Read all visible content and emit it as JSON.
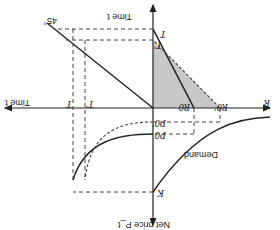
{
  "diagram": {
    "orientation": "rotated-180",
    "colors": {
      "ink": "#222222",
      "shade": "#c8c8c8",
      "dash": "#444444",
      "background": "#ffffff"
    },
    "axes": {
      "horizontal_right": "R",
      "horizontal_left": "Time t",
      "vertical_up": "Time t",
      "vertical_down": "Net price P_t"
    },
    "labels": {
      "T": "T",
      "T_prime": "T'",
      "T_left": "T",
      "T_prime_left": "T'",
      "R0": "R0",
      "R0_prime": "R0'",
      "P0": "P0",
      "P0_prime": "P0'",
      "K": "K",
      "demand": "Demand",
      "angle": "45°"
    }
  }
}
